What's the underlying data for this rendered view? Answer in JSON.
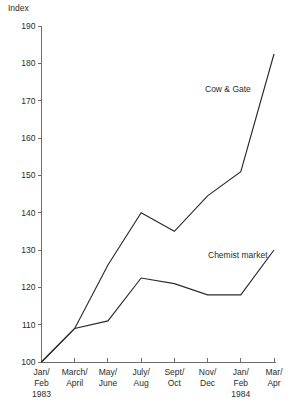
{
  "chart_data": {
    "type": "line",
    "title": "",
    "ylabel": "Index",
    "xlabel": "",
    "ylim": [
      100,
      190
    ],
    "yticks": [
      100,
      110,
      120,
      130,
      140,
      150,
      160,
      170,
      180,
      190
    ],
    "grid": false,
    "legend": "inline-labels",
    "categories": [
      "Jan/ Feb 1983",
      "March/ April",
      "May/ June",
      "July/ Aug",
      "Sept/ Oct",
      "Nov/ Dec",
      "Jan/ Feb 1984",
      "Mar/ Apr"
    ],
    "category_lines": [
      [
        "Jan/",
        "Feb",
        "1983"
      ],
      [
        "March/",
        "April",
        ""
      ],
      [
        "May/",
        "June",
        ""
      ],
      [
        "July/",
        "Aug",
        ""
      ],
      [
        "Sept/",
        "Oct",
        ""
      ],
      [
        "Nov/",
        "Dec",
        ""
      ],
      [
        "Jan/",
        "Feb",
        "1984"
      ],
      [
        "Mar/",
        "Apr",
        ""
      ]
    ],
    "series": [
      {
        "name": "Cow & Gate",
        "color": "#2b2b2b",
        "values": [
          100,
          109,
          126,
          140,
          135,
          144.5,
          151,
          182.5
        ],
        "label_x": 205,
        "label_y": 92
      },
      {
        "name": "Chemist market",
        "color": "#2b2b2b",
        "values": [
          100,
          109,
          111,
          122.5,
          121,
          118,
          118,
          130
        ],
        "label_x": 208,
        "label_y": 258
      }
    ]
  },
  "axis": {
    "y_title": "Index",
    "tick_labels_y": [
      "190",
      "180",
      "170",
      "160",
      "150",
      "140",
      "130",
      "120",
      "110",
      "100"
    ]
  }
}
